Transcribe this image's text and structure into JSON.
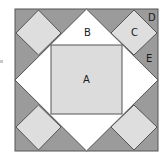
{
  "diagram": {
    "type": "quilt-block",
    "colors": {
      "background": "#ffffff",
      "dark_fill": "#9b9b9b",
      "light_fill": "#dedede",
      "white_fill": "#ffffff",
      "center_fill": "#dcdcdc",
      "stroke": "#555555",
      "label": "#1a1a1a"
    },
    "labels": {
      "A": "A",
      "B": "B",
      "C": "C",
      "D": "D",
      "E": "E"
    },
    "pieces": [
      {
        "id": "A",
        "shape": "square",
        "description": "center square"
      },
      {
        "id": "B",
        "shape": "triangle",
        "description": "white triangles surrounding center square"
      },
      {
        "id": "C",
        "shape": "square-on-point",
        "description": "light corner diamonds"
      },
      {
        "id": "D",
        "shape": "triangle",
        "description": "dark corner triangle"
      },
      {
        "id": "E",
        "shape": "triangle",
        "description": "dark side triangle"
      }
    ]
  }
}
